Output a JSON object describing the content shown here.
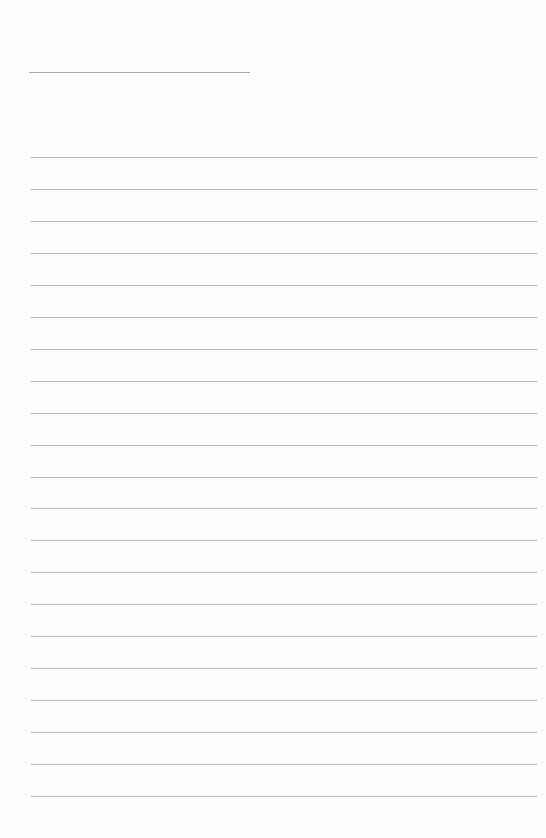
{
  "page": {
    "type": "lined-paper",
    "background_color": "#fefefe",
    "rule_color": "#b9b9b9",
    "header_line": {
      "top": 72,
      "left": 29,
      "width": 221
    },
    "body_lines": {
      "count": 21,
      "first_top": 157,
      "spacing": 31.95,
      "left": 31,
      "width": 506
    }
  }
}
